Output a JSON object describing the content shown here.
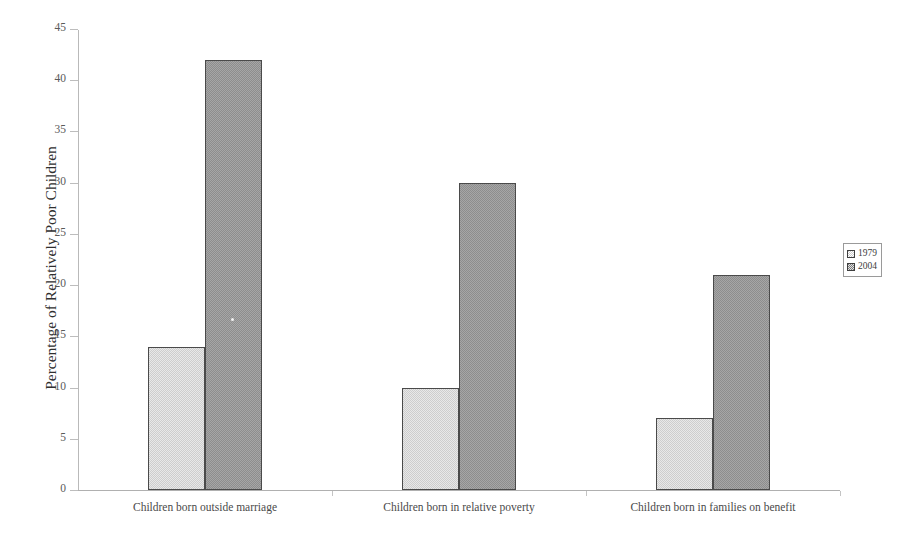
{
  "chart_data": {
    "type": "bar",
    "title": "",
    "title_note": "title cropped off at top edge of image; not legible",
    "xlabel": "",
    "ylabel": "Percentage of Relatively Poor Children",
    "categories": [
      "Children born outside marriage",
      "Children born in relative poverty",
      "Children born in families on benefit"
    ],
    "series": [
      {
        "name": "1979",
        "values": [
          14,
          10,
          7
        ],
        "color": "#cdcdcd"
      },
      {
        "name": "2004",
        "values": [
          42,
          30,
          21
        ],
        "color": "#8d8d8d"
      }
    ],
    "ylim": [
      0,
      45
    ],
    "ytick_step": 5,
    "yticks": [
      0,
      5,
      10,
      15,
      20,
      25,
      30,
      35,
      40,
      45
    ],
    "ytick_labels": [
      "0",
      "5",
      "10",
      "15",
      "20",
      "25",
      "30",
      "35",
      "40",
      "45"
    ],
    "grid": false,
    "legend_position": "right",
    "legend_entries": [
      "1979",
      "2004"
    ]
  },
  "axis": {
    "y_title": "Percentage of Relatively Poor Children"
  },
  "legend": {
    "entries": [
      {
        "label": "1979",
        "swatch": "legend-swatch-1979"
      },
      {
        "label": "2004",
        "swatch": "legend-swatch-2004"
      }
    ]
  }
}
